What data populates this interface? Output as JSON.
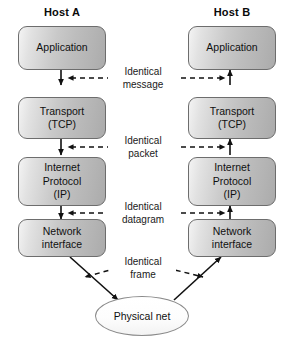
{
  "diagram": {
    "background_color": "#ffffff",
    "line_color": "#111111"
  },
  "hosts": [
    {
      "id": "host-a",
      "title": "Host A"
    },
    {
      "id": "host-b",
      "title": "Host B"
    }
  ],
  "layers": [
    {
      "id": "application",
      "label": "Application"
    },
    {
      "id": "transport",
      "label": "Transport\n(TCP)"
    },
    {
      "id": "internet",
      "label": "Internet\nProtocol\n(IP)"
    },
    {
      "id": "network-interface",
      "label": "Network\ninterface"
    }
  ],
  "host_a_layers": [
    {
      "id": "a-application",
      "label": "Application"
    },
    {
      "id": "a-transport",
      "label": "Transport\n(TCP)"
    },
    {
      "id": "a-internet",
      "label": "Internet\nProtocol\n(IP)"
    },
    {
      "id": "a-network-interface",
      "label": "Network\ninterface"
    }
  ],
  "host_b_layers": [
    {
      "id": "b-application",
      "label": "Application"
    },
    {
      "id": "b-transport",
      "label": "Transport\n(TCP)"
    },
    {
      "id": "b-internet",
      "label": "Internet\nProtocol\n(IP)"
    },
    {
      "id": "b-network-interface",
      "label": "Network\ninterface"
    }
  ],
  "peer_links": [
    {
      "id": "link-message",
      "label": "Identical\nmessage",
      "between": "application"
    },
    {
      "id": "link-packet",
      "label": "Identical\npacket",
      "between": "transport"
    },
    {
      "id": "link-datagram",
      "label": "Identical\ndatagram",
      "between": "internet"
    },
    {
      "id": "link-frame",
      "label": "Identical\nframe",
      "between": "network-interface"
    }
  ],
  "physical_net": {
    "id": "physical-net",
    "label": "Physical net"
  }
}
